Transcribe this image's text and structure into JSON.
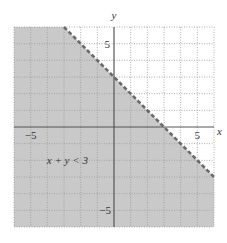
{
  "chart_data": {
    "type": "inequality-region",
    "title": "",
    "inequality_label": "x + y < 3",
    "boundary": {
      "equation": "x + y = 3",
      "style": "dashed",
      "points": [
        [
          -3,
          6
        ],
        [
          6,
          -3
        ]
      ]
    },
    "shaded_region": "below boundary (x + y < 3)",
    "shaded_polygon": [
      [
        -6,
        6
      ],
      [
        -3,
        6
      ],
      [
        6,
        -3
      ],
      [
        6,
        -6
      ],
      [
        -6,
        -6
      ]
    ],
    "xlabel": "x",
    "ylabel": "y",
    "xlim": [
      -6,
      6
    ],
    "ylim": [
      -6,
      6
    ],
    "x_tick_labels": [
      {
        "value": -5,
        "label": "−5"
      },
      {
        "value": 5,
        "label": "5"
      }
    ],
    "y_tick_labels": [
      {
        "value": 5,
        "label": "5"
      },
      {
        "value": -5,
        "label": "−5"
      }
    ],
    "grid": true,
    "grid_step": 1,
    "grid_style": "dotted"
  },
  "colors": {
    "shade": "#c9c9c9",
    "grid": "#9a9a9a",
    "axis": "#555555",
    "boundary": "#6a6a6a",
    "text": "#333333",
    "background": "#ffffff"
  },
  "labels": {
    "x_axis": "x",
    "y_axis": "y",
    "x_neg5": "−5",
    "x_pos5": "5",
    "y_pos5": "5",
    "y_neg5": "−5",
    "inequality": "x + y < 3"
  }
}
